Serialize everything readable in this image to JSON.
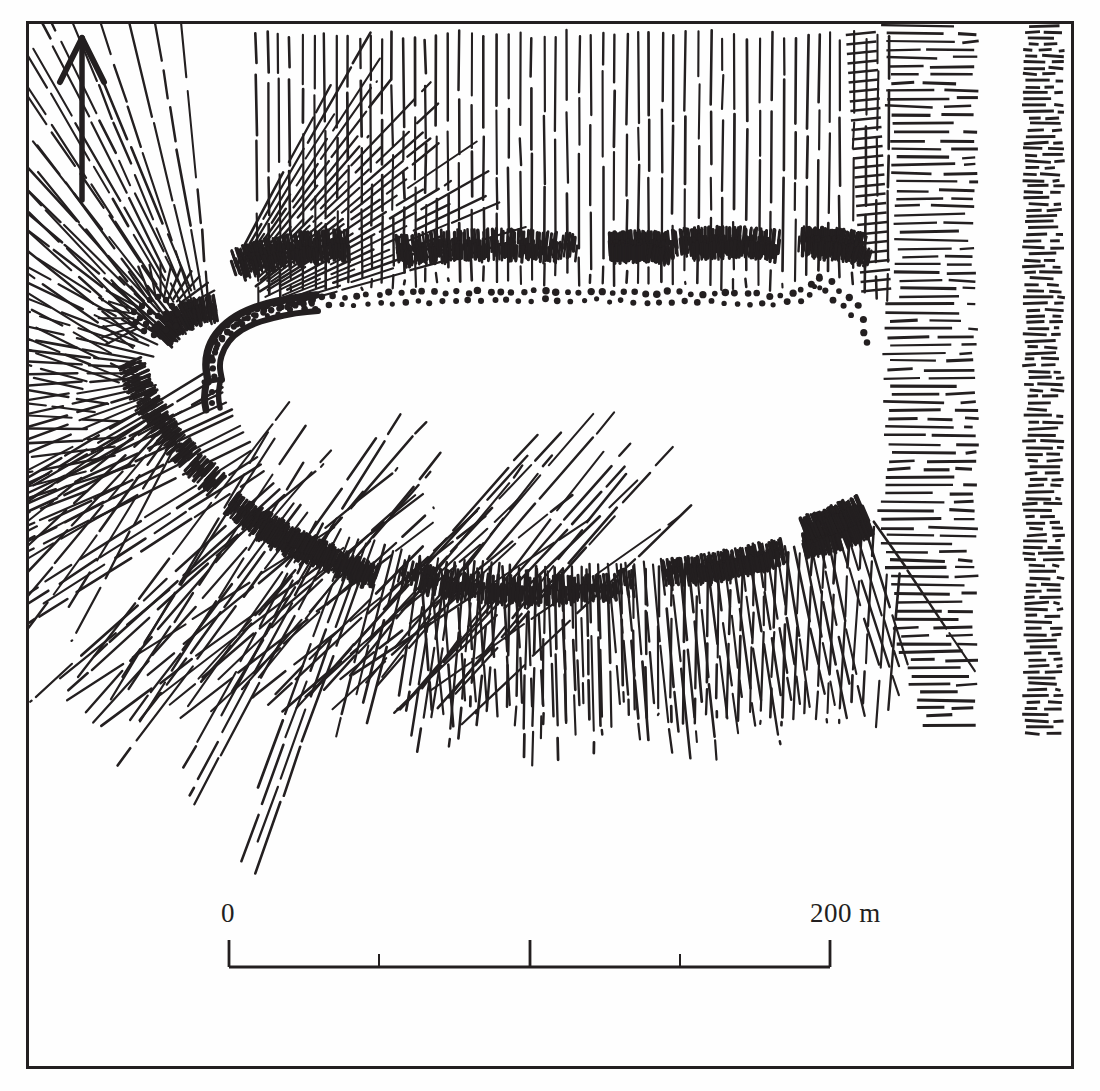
{
  "plate": {
    "kind": "archaeological-site-plan",
    "subject": "hillfort enclosure survey with hachure slope shading",
    "background_color": "#fefefe",
    "ink_color": "#231f20",
    "frame": {
      "name": "plate-border",
      "x": 27,
      "y": 22,
      "width": 1045,
      "height": 1045,
      "stroke_width": 3
    }
  },
  "north_arrow": {
    "label": "north-arrow",
    "direction": "up",
    "tip_x": 82,
    "tip_y": 38,
    "tail_x": 82,
    "tail_y": 200,
    "head_half_width": 22,
    "head_length": 42,
    "shaft_width": 5
  },
  "scale_bar": {
    "name": "scale-bar",
    "start_label": "0",
    "end_label": "200 m",
    "unit": "m",
    "min_value": 0,
    "max_value": 200,
    "bar_x_start": 229,
    "bar_x_end": 830,
    "bar_y": 967,
    "bar_thickness": 3,
    "ticks": [
      {
        "value": 0,
        "x": 229,
        "height": 27,
        "major": true
      },
      {
        "value": 50,
        "x": 379,
        "height": 13,
        "major": false
      },
      {
        "value": 100,
        "x": 530,
        "height": 27,
        "major": true
      },
      {
        "value": 150,
        "x": 680,
        "height": 13,
        "major": false
      },
      {
        "value": 200,
        "x": 830,
        "height": 27,
        "major": true
      }
    ]
  },
  "map_features": {
    "interior_plateau": {
      "name": "enclosure-interior",
      "description": "blank level interior of the fort"
    },
    "rampart_crest_dotted": {
      "name": "rampart-crest-dotted-line",
      "description": "dotted line marking the crest of the north and north-east rampart"
    },
    "stone_wall": {
      "name": "stone-wall-revetment",
      "description": "heavy double line with infill dots at the western entrance, surviving stone revetment"
    },
    "north_slope": {
      "name": "north-slope-hachures",
      "description": "long vertical hachure lines descending the northern slope"
    },
    "west_radiating_slope": {
      "name": "west-radiating-hachures",
      "description": "fan of radiating hachures around the western tip"
    },
    "south_slope": {
      "name": "south-slope-hachures",
      "description": "hachures descending the southern flank with intermediate scarp bands"
    },
    "east_escarpment": {
      "name": "east-escarpment-hachures",
      "description": "dense horizontal hachure band on the steep eastern side"
    },
    "far_east_cliff": {
      "name": "far-east-cliff-band",
      "description": "narrow vertical band of dense short hachures along the eastern plate edge"
    },
    "scarp_tufts": {
      "name": "scarp-tuft-symbols",
      "description": "short barbed tufts marking minor breaks of slope / terrace scarps"
    }
  }
}
